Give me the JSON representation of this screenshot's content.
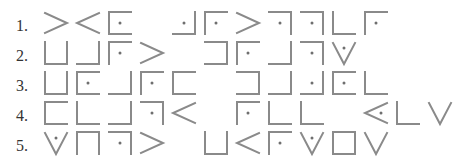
{
  "puzzle": {
    "description": "Pigpen cipher encoded lines",
    "stroke_color": "#8a8a8a",
    "lines": [
      {
        "number": "1.",
        "glyphs": [
          {
            "col": 0,
            "shape": "gt",
            "dot": false
          },
          {
            "col": 1,
            "shape": "lt",
            "dot": false
          },
          {
            "col": 2,
            "shape": "C",
            "dot": true
          },
          {
            "col": 4,
            "shape": "J",
            "dot": true
          },
          {
            "col": 5,
            "shape": "F",
            "dot": true
          },
          {
            "col": 6,
            "shape": "gt",
            "dot": false
          },
          {
            "col": 7,
            "shape": "7",
            "dot": true
          },
          {
            "col": 8,
            "shape": "7",
            "dot": true
          },
          {
            "col": 9,
            "shape": "L",
            "dot": false
          },
          {
            "col": 10,
            "shape": "F",
            "dot": true
          }
        ]
      },
      {
        "number": "2.",
        "glyphs": [
          {
            "col": 0,
            "shape": "U",
            "dot": false
          },
          {
            "col": 1,
            "shape": "J",
            "dot": false
          },
          {
            "col": 2,
            "shape": "F",
            "dot": true
          },
          {
            "col": 3,
            "shape": "gt",
            "dot": false
          },
          {
            "col": 5,
            "shape": "]",
            "dot": false
          },
          {
            "col": 6,
            "shape": "F",
            "dot": true
          },
          {
            "col": 7,
            "shape": "J",
            "dot": false
          },
          {
            "col": 8,
            "shape": "7",
            "dot": true
          },
          {
            "col": 9,
            "shape": "V",
            "dot": true
          }
        ]
      },
      {
        "number": "3.",
        "glyphs": [
          {
            "col": 0,
            "shape": "U",
            "dot": false
          },
          {
            "col": 1,
            "shape": "C",
            "dot": true
          },
          {
            "col": 2,
            "shape": "J",
            "dot": false
          },
          {
            "col": 3,
            "shape": "F",
            "dot": true
          },
          {
            "col": 4,
            "shape": "C",
            "dot": false
          },
          {
            "col": 6,
            "shape": "]",
            "dot": false
          },
          {
            "col": 7,
            "shape": "J",
            "dot": false
          },
          {
            "col": 8,
            "shape": "J",
            "dot": true
          },
          {
            "col": 9,
            "shape": "C",
            "dot": true
          },
          {
            "col": 10,
            "shape": "L",
            "dot": false
          }
        ]
      },
      {
        "number": "4.",
        "glyphs": [
          {
            "col": 0,
            "shape": "C",
            "dot": false
          },
          {
            "col": 1,
            "shape": "L",
            "dot": false
          },
          {
            "col": 2,
            "shape": "J",
            "dot": false
          },
          {
            "col": 3,
            "shape": "7",
            "dot": true
          },
          {
            "col": 4,
            "shape": "lt",
            "dot": false
          },
          {
            "col": 6,
            "shape": "F",
            "dot": true
          },
          {
            "col": 7,
            "shape": "L",
            "dot": false
          },
          {
            "col": 8,
            "shape": "L",
            "dot": false
          },
          {
            "col": 10,
            "shape": "lt",
            "dot": true
          },
          {
            "col": 11,
            "shape": "L",
            "dot": false
          },
          {
            "col": 12,
            "shape": "V",
            "dot": false
          }
        ]
      },
      {
        "number": "5.",
        "glyphs": [
          {
            "col": 0,
            "shape": "V",
            "dot": true
          },
          {
            "col": 1,
            "shape": "n",
            "dot": false
          },
          {
            "col": 2,
            "shape": "7",
            "dot": true
          },
          {
            "col": 3,
            "shape": "gt",
            "dot": false
          },
          {
            "col": 5,
            "shape": "U",
            "dot": false
          },
          {
            "col": 6,
            "shape": "lt",
            "dot": false
          },
          {
            "col": 7,
            "shape": "F",
            "dot": true
          },
          {
            "col": 8,
            "shape": "V",
            "dot": true
          },
          {
            "col": 9,
            "shape": "box",
            "dot": false
          },
          {
            "col": 10,
            "shape": "V",
            "dot": false
          }
        ]
      }
    ]
  }
}
